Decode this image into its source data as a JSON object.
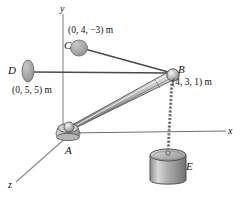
{
  "figure": {
    "background_color": "#ffffff",
    "stroke_color": "#3a3a3a",
    "metal_light": "#f2f2f2",
    "metal_mid": "#b9b9b9",
    "metal_dark": "#6f6f6f",
    "disc_color": "#a9a9a9"
  },
  "axes": [
    {
      "key": "y",
      "label": "y",
      "name": "y-axis"
    },
    {
      "key": "x",
      "label": "x",
      "name": "x-axis"
    },
    {
      "key": "z",
      "label": "z",
      "name": "z-axis"
    }
  ],
  "points": {
    "A": {
      "label": "A",
      "coord": ""
    },
    "B": {
      "label": "B",
      "coord": "(4, 3, 1) m"
    },
    "C": {
      "label": "C",
      "coord": "(0, 4, −3) m"
    },
    "D": {
      "label": "D",
      "coord": "(0, 5, 5) m"
    },
    "E": {
      "label": "E",
      "coord": ""
    }
  },
  "members": [
    {
      "name": "boom-AB",
      "from": "A",
      "to": "B",
      "type": "boom"
    },
    {
      "name": "cable-CB",
      "from": "C",
      "to": "B",
      "type": "cable"
    },
    {
      "name": "cable-DB",
      "from": "D",
      "to": "B",
      "type": "cable"
    },
    {
      "name": "chain-BE",
      "from": "B",
      "to": "E",
      "type": "chain"
    }
  ]
}
